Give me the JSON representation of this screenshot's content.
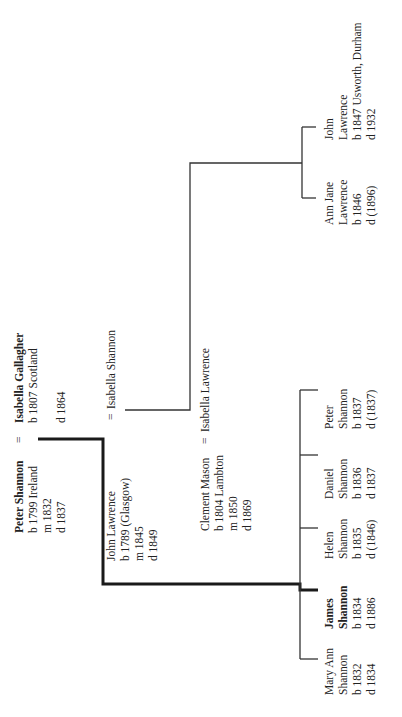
{
  "tree": {
    "couple1": {
      "husband": {
        "name": "Peter Shannon",
        "lines": [
          "b 1799 Ireland",
          "m 1832",
          "d 1837"
        ]
      },
      "symbol": "=",
      "wife": {
        "name": "Isabella Gallagher",
        "lines": [
          "b 1807 Scotland",
          "",
          "d 1864"
        ]
      }
    },
    "couple2": {
      "husband": {
        "name": "John Lawrence",
        "lines": [
          "b 1789 (Glasgow)",
          "m 1845",
          "d 1849"
        ]
      },
      "symbol": "=",
      "wife": {
        "name": "Isabella Shannon"
      }
    },
    "couple3": {
      "husband": {
        "name": "Clement Mason",
        "lines": [
          "b 1804 Lambton",
          "m 1850",
          "d 1869"
        ]
      },
      "symbol": "=",
      "wife": {
        "name": "Isabella Lawrence"
      }
    },
    "shannon_children": [
      {
        "first": "Mary Ann",
        "last": "Shannon",
        "born": "b 1832",
        "died": "d 1834",
        "highlight": false
      },
      {
        "first": "James",
        "last": "Shannon",
        "born": "b 1834",
        "died": "d 1886",
        "highlight": true
      },
      {
        "first": "Helen",
        "last": "Shannon",
        "born": "b 1835",
        "died": "d (1846)",
        "highlight": false
      },
      {
        "first": "Daniel",
        "last": "Shannon",
        "born": "b 1836",
        "died": "d 1837",
        "highlight": false
      },
      {
        "first": "Peter",
        "last": "Shannon",
        "born": "b 1837",
        "died": "d (1837)",
        "highlight": false
      }
    ],
    "lawrence_children": [
      {
        "first": "Ann Jane",
        "last": "Lawrence",
        "born": "b 1846",
        "died": "d (1896)"
      },
      {
        "first": "John",
        "last": "Lawrence",
        "born": "b 1847 Usworth, Durham",
        "died": "d 1932"
      }
    ]
  },
  "colors": {
    "line": "#333333",
    "thick_line": "#1a1a1a",
    "text": "#222222",
    "background": "#ffffff"
  }
}
